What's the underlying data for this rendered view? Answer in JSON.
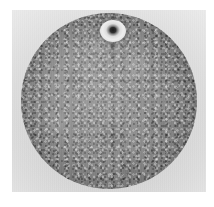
{
  "image": {
    "kind": "grayscale-specimen-photograph",
    "subject_label": "circular specimen disk",
    "caption": "",
    "palette": {
      "page_background": "#ffffff",
      "plate_background": "#dcdcdc",
      "disk_core": "#919191",
      "disk_rim": "#666666",
      "feature_highlight": "#ededed",
      "feature_core": "#1a1a1a"
    },
    "panel": {
      "left": 12,
      "top": 10,
      "width": 194,
      "height": 182
    },
    "disk": {
      "center_x": 109,
      "center_y": 101,
      "diameter": 176,
      "description": "large mottled grey circle with soft dark rim, edges fading into the light plate background"
    },
    "features": [
      {
        "name": "bright-annulus",
        "center_x": 101,
        "center_y": 31,
        "width": 26,
        "height": 22,
        "description": "bright ring with small dark central core near the top of the disk"
      },
      {
        "name": "dark-streak",
        "center_x": 100,
        "top": 40,
        "length": 28,
        "description": "faint thin dark streak trailing downward from the bright annulus"
      }
    ]
  }
}
